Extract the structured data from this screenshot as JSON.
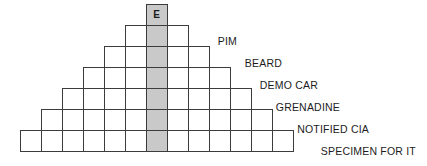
{
  "puzzle": {
    "type": "word-pyramid",
    "rows": 7,
    "shaded_column_letter": "E",
    "geometry": {
      "cell_size": 22,
      "top_y": 4,
      "center_x": 156.5,
      "row_cell_counts": [
        1,
        3,
        5,
        7,
        9,
        11,
        13
      ]
    },
    "cells": {
      "row1": [
        {
          "letter": "E",
          "shaded": true
        }
      ],
      "row2": [
        {
          "letter": "",
          "shaded": false
        },
        {
          "letter": "",
          "shaded": true
        },
        {
          "letter": "",
          "shaded": false
        }
      ],
      "row3": [
        {
          "letter": "",
          "shaded": false
        },
        {
          "letter": "",
          "shaded": false
        },
        {
          "letter": "",
          "shaded": true
        },
        {
          "letter": "",
          "shaded": false
        },
        {
          "letter": "",
          "shaded": false
        }
      ],
      "row4": [
        {
          "letter": "",
          "shaded": false
        },
        {
          "letter": "",
          "shaded": false
        },
        {
          "letter": "",
          "shaded": false
        },
        {
          "letter": "",
          "shaded": true
        },
        {
          "letter": "",
          "shaded": false
        },
        {
          "letter": "",
          "shaded": false
        },
        {
          "letter": "",
          "shaded": false
        }
      ],
      "row5": [
        {
          "letter": "",
          "shaded": false
        },
        {
          "letter": "",
          "shaded": false
        },
        {
          "letter": "",
          "shaded": false
        },
        {
          "letter": "",
          "shaded": false
        },
        {
          "letter": "",
          "shaded": true
        },
        {
          "letter": "",
          "shaded": false
        },
        {
          "letter": "",
          "shaded": false
        },
        {
          "letter": "",
          "shaded": false
        },
        {
          "letter": "",
          "shaded": false
        }
      ],
      "row6": [
        {
          "letter": "",
          "shaded": false
        },
        {
          "letter": "",
          "shaded": false
        },
        {
          "letter": "",
          "shaded": false
        },
        {
          "letter": "",
          "shaded": false
        },
        {
          "letter": "",
          "shaded": false
        },
        {
          "letter": "",
          "shaded": true
        },
        {
          "letter": "",
          "shaded": false
        },
        {
          "letter": "",
          "shaded": false
        },
        {
          "letter": "",
          "shaded": false
        },
        {
          "letter": "",
          "shaded": false
        },
        {
          "letter": "",
          "shaded": false
        }
      ],
      "row7": [
        {
          "letter": "",
          "shaded": false
        },
        {
          "letter": "",
          "shaded": false
        },
        {
          "letter": "",
          "shaded": false
        },
        {
          "letter": "",
          "shaded": false
        },
        {
          "letter": "",
          "shaded": false
        },
        {
          "letter": "",
          "shaded": false
        },
        {
          "letter": "",
          "shaded": true
        },
        {
          "letter": "",
          "shaded": false
        },
        {
          "letter": "",
          "shaded": false
        },
        {
          "letter": "",
          "shaded": false
        },
        {
          "letter": "",
          "shaded": false
        },
        {
          "letter": "",
          "shaded": false
        },
        {
          "letter": "",
          "shaded": false
        }
      ]
    },
    "clues": [
      {
        "row": 2,
        "text": "PIM",
        "right_px": 237,
        "top_px": 35
      },
      {
        "row": 3,
        "text": "BEARD",
        "right_px": 282,
        "top_px": 57
      },
      {
        "row": 4,
        "text": "DEMO CAR",
        "right_px": 318,
        "top_px": 79
      },
      {
        "row": 5,
        "text": "GRENADINE",
        "right_px": 340,
        "top_px": 101
      },
      {
        "row": 6,
        "text": "NOTIFIED CIA",
        "right_px": 369,
        "top_px": 123
      },
      {
        "row": 7,
        "text": "SPECIMEN FOR IT",
        "right_px": 416,
        "top_px": 145
      }
    ]
  },
  "colors": {
    "cell_border": "#3c3c3c",
    "cell_fill": "#ffffff",
    "shaded_fill": "#c9c9c9",
    "text": "#1c1c1c",
    "background": "#ffffff"
  }
}
